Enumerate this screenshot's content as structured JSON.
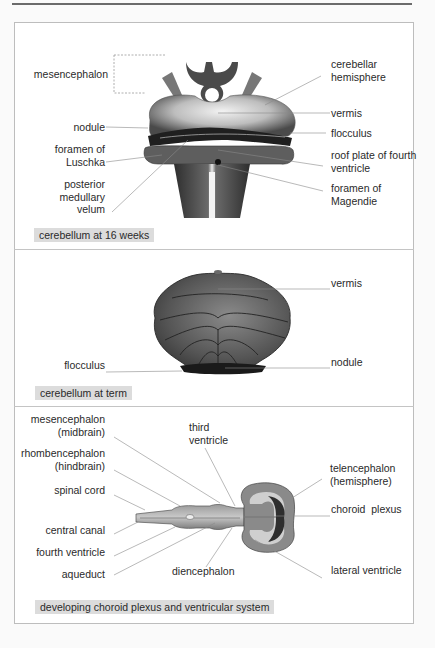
{
  "panels": [
    {
      "caption": "cerebellum at 16 weeks",
      "labels": {
        "mesencephalon": "mesencephalon",
        "cerebellar_hemisphere": "cerebellar\nhemisphere",
        "vermis": "vermis",
        "nodule": "nodule",
        "flocculus": "flocculus",
        "foramen_luschka": "foramen of\nLuschka",
        "roof_plate": "roof plate of fourth\nventricle",
        "posterior_medullary_velum": "posterior\nmedullary\nvelum",
        "foramen_magendie": "foramen of\nMagendie"
      }
    },
    {
      "caption": "cerebellum at term",
      "labels": {
        "vermis": "vermis",
        "flocculus": "flocculus",
        "nodule": "nodule"
      }
    },
    {
      "caption": "developing choroid plexus and ventricular system",
      "labels": {
        "mesencephalon": "mesencephalon\n(midbrain)",
        "third_ventricle": "third\nventricle",
        "rhombencephalon": "rhombencephalon\n(hindbrain)",
        "telencephalon": "telencephalon\n(hemisphere)",
        "spinal_cord": "spinal cord",
        "choroid_plexus": "choroid  plexus",
        "central_canal": "central canal",
        "fourth_ventricle": "fourth ventricle",
        "aqueduct": "aqueduct",
        "diencephalon": "diencephalon",
        "lateral_ventricle": "lateral ventricle"
      }
    }
  ],
  "colors": {
    "caption_bg": "#dcdcdc",
    "frame": "#bdbdbd",
    "leader": "#8a8a8a",
    "tissue_dark": "#3a3a3a",
    "tissue_mid": "#7a7a7a",
    "tissue_light": "#cfcfcf"
  }
}
